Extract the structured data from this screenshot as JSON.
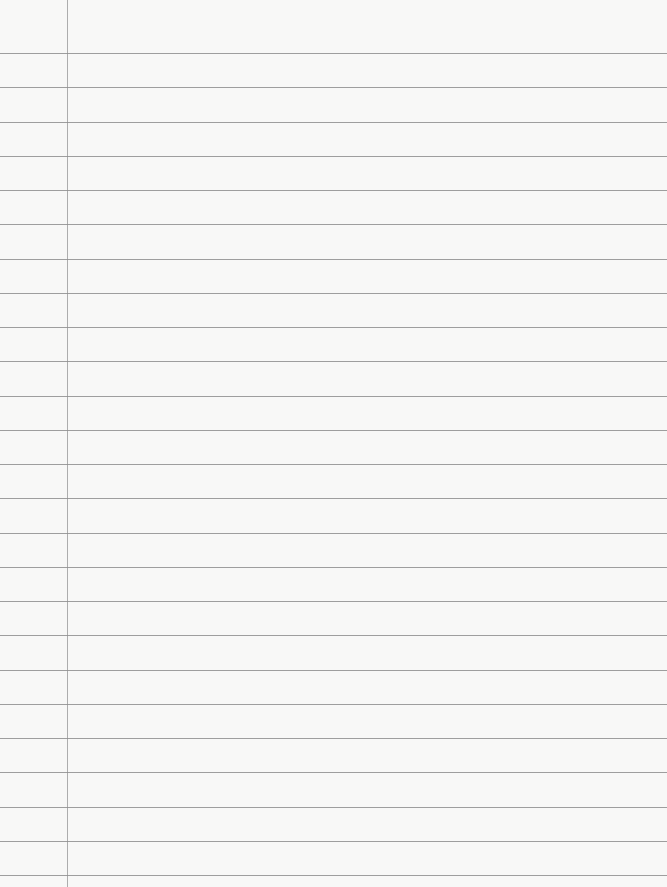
{
  "paper": {
    "type": "lined-notebook-paper",
    "background_color": "#f8f8f7",
    "rule_color": "#8e8e8e",
    "margin_color": "#9a9a9a",
    "first_rule_y": 53,
    "rule_spacing": 34.25,
    "rule_count": 25,
    "margin_x": 67
  }
}
